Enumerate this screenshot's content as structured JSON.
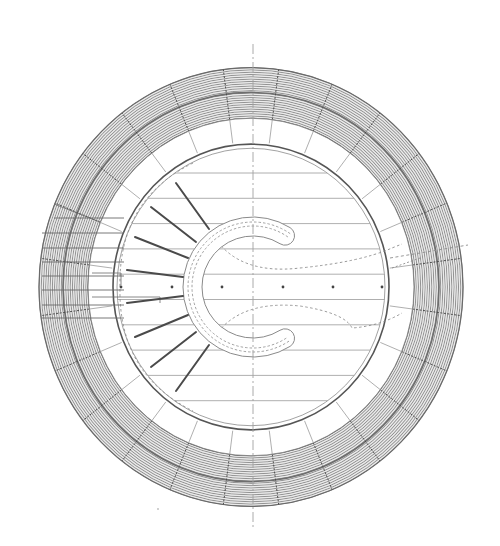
{
  "drawing": {
    "type": "circular-building-plan",
    "description": "Architectural plan of a circular structure with concentric hatched outer rings, radial partition lines, a C-shaped central element, radiating spokes and a horizontal hatch pattern",
    "colors": {
      "background": "#ffffff",
      "ring_hatch": "#8a8a8a",
      "ring_fill": "#d8d8d8",
      "line_light": "#9a9a9a",
      "line_dark": "#4a4a4a",
      "dashed": "#8c8c8c",
      "axis": "#a0a0a0"
    },
    "outer_band": {
      "hatch_line_count": 22,
      "radial_divisions": 24,
      "has_mid_separator": true
    },
    "inner_white_ring": {
      "radial_divisions": 24
    },
    "inner_floor": {
      "horizontal_lines": 10,
      "double_outline": true
    },
    "c_element": {
      "opening": "right",
      "dashed_inner_tracks": 2
    },
    "spokes": {
      "count": 8,
      "side": "left"
    },
    "markers": {
      "dot_count": 6
    },
    "center_axis": {
      "style": "dash-dot",
      "orientation": "vertical"
    }
  }
}
